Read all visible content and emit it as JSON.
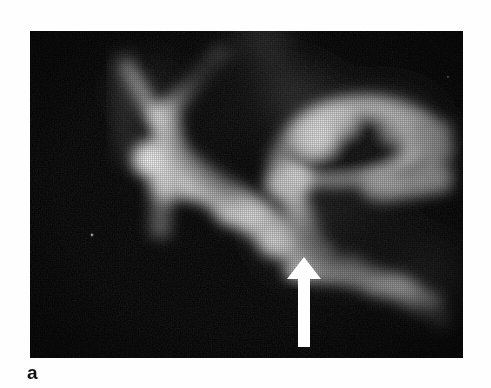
{
  "figure": {
    "panel_label": "a",
    "modality_caption": "",
    "image_alt": "grayscale radiographic tomogram with white arrow marker",
    "panel": {
      "left": 30,
      "top": 31,
      "width": 433,
      "height": 327,
      "background_color": "#000000",
      "page_background_color": "#ffffff"
    },
    "annotations": [
      {
        "name": "arrow-marker",
        "type": "arrow",
        "direction": "up",
        "color": "#ffffff",
        "tip_x": 287,
        "tip_y": 279,
        "tail_y": 347,
        "head_width": 34,
        "head_height": 24,
        "shaft_width": 11
      }
    ],
    "structures": [
      {
        "name": "upper-left-y-branch",
        "brightness": "bright",
        "cx": 135,
        "cy": 90
      },
      {
        "name": "central-diagonal-band",
        "brightness": "bright",
        "cx": 215,
        "cy": 215
      },
      {
        "name": "ring-structure-right",
        "brightness": "bright",
        "cx": 325,
        "cy": 125
      },
      {
        "name": "lower-right-band",
        "brightness": "bright",
        "cx": 360,
        "cy": 275
      },
      {
        "name": "central-dark-cavity",
        "brightness": "dark",
        "cx": 215,
        "cy": 120
      }
    ]
  }
}
